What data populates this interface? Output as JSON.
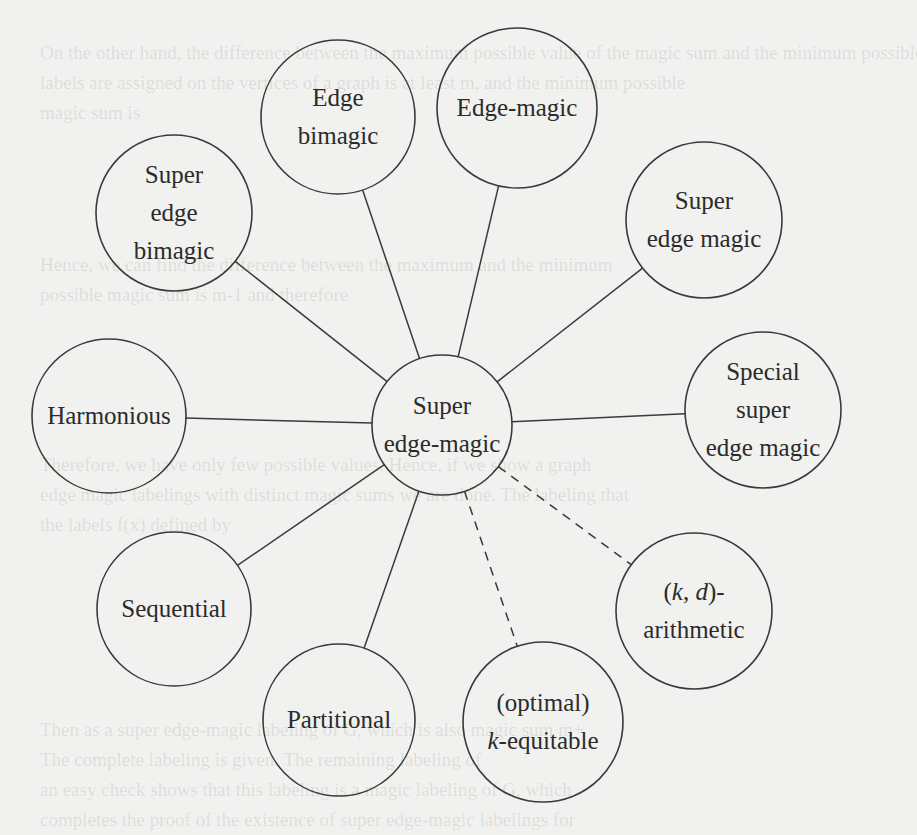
{
  "diagram": {
    "title": "",
    "center": {
      "id": "super-edge-magic",
      "lines": [
        "Super",
        "edge-magic"
      ],
      "cx": 442,
      "cy": 425,
      "r": 70
    },
    "nodes": [
      {
        "id": "edge-bimagic",
        "lines": [
          "Edge",
          "bimagic"
        ],
        "cx": 338,
        "cy": 117,
        "r": 77,
        "edge": "solid"
      },
      {
        "id": "edge-magic",
        "lines": [
          "Edge-magic"
        ],
        "cx": 517,
        "cy": 108,
        "r": 80,
        "edge": "solid"
      },
      {
        "id": "super-edge-bimagic",
        "lines": [
          "Super",
          "edge",
          "bimagic"
        ],
        "cx": 174,
        "cy": 213,
        "r": 78,
        "edge": "solid"
      },
      {
        "id": "super-edge-magic-2",
        "lines": [
          "Super",
          "edge magic"
        ],
        "cx": 704,
        "cy": 220,
        "r": 78,
        "edge": "solid"
      },
      {
        "id": "harmonious",
        "lines": [
          "Harmonious"
        ],
        "cx": 109,
        "cy": 416,
        "r": 77,
        "edge": "solid"
      },
      {
        "id": "special-super-edge-magic",
        "lines": [
          "Special",
          "super",
          "edge magic"
        ],
        "cx": 763,
        "cy": 410,
        "r": 78,
        "edge": "solid"
      },
      {
        "id": "sequential",
        "lines": [
          "Sequential"
        ],
        "cx": 174,
        "cy": 609,
        "r": 77,
        "edge": "solid"
      },
      {
        "id": "kd-arithmetic",
        "lines": [
          "(k, d)-",
          "arithmetic"
        ],
        "cx": 694,
        "cy": 611,
        "r": 78,
        "edge": "dashed"
      },
      {
        "id": "partitional",
        "lines": [
          "Partitional"
        ],
        "cx": 339,
        "cy": 720,
        "r": 76,
        "edge": "solid"
      },
      {
        "id": "optimal-k-equitable",
        "lines": [
          "(optimal)",
          "k-equitable"
        ],
        "cx": 543,
        "cy": 722,
        "r": 80,
        "edge": "dashed"
      }
    ]
  },
  "ghost_text": [
    {
      "y": 58,
      "text": "On the other hand, the difference between the maximum possible value of the magic sum and the minimum possible"
    },
    {
      "y": 88,
      "text": "labels are assigned on the vertices of a graph is at least m, and the minimum possible"
    },
    {
      "y": 118,
      "text": "magic sum is"
    },
    {
      "y": 270,
      "text": "Hence, we can find the difference between the maximum and the minimum"
    },
    {
      "y": 300,
      "text": "possible magic sum is m-1 and therefore"
    },
    {
      "y": 470,
      "text": "Therefore, we have only few possible values. Hence, if we show a graph"
    },
    {
      "y": 500,
      "text": "edge magic labelings with distinct magic sums we are done. The labeling that"
    },
    {
      "y": 530,
      "text": "the labels f(x) defined by"
    },
    {
      "y": 735,
      "text": "Then as a super edge-magic labeling of G, which is also magic sum m+"
    },
    {
      "y": 765,
      "text": "The complete labeling is given. The remaining labeling of"
    },
    {
      "y": 795,
      "text": "an easy check shows that this labeling is a magic labeling of G, which"
    },
    {
      "y": 825,
      "text": "completes the proof of the existence of super edge-magic labelings for"
    }
  ],
  "colors": {
    "stroke": "#3a3a3a",
    "background": "#f1f1ef",
    "text": "#2b2b2b"
  }
}
